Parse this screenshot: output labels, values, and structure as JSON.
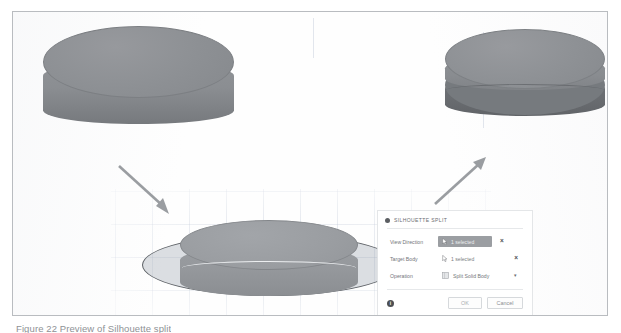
{
  "figure": {
    "caption": "Figure 22 Preview of Silhouette split"
  },
  "viewport": {
    "left_model_name": "solid-cylinder",
    "right_model_name": "split-cylinder",
    "preview_model_name": "preview-cylinder-with-split-plane",
    "arrow_down_right": "arrow-down-right",
    "arrow_up_right": "arrow-up-right"
  },
  "dialog": {
    "title": "SILHOUETTE SPLIT",
    "fields": [
      {
        "label": "View Direction",
        "value": "1 selected",
        "icon": "cursor-select-icon",
        "clear": "×",
        "active": true
      },
      {
        "label": "Target Body",
        "value": "1 selected",
        "icon": "cursor-select-icon",
        "clear": "×",
        "active": false
      }
    ],
    "operation": {
      "label": "Operation",
      "value": "Split Solid Body",
      "icon": "solid-body-icon",
      "caret": "▾",
      "options": [
        "Split Solid Body"
      ]
    },
    "footer": {
      "info": "i",
      "ok_label": "OK",
      "cancel_label": "Cancel"
    }
  },
  "colors": {
    "body_light": "#8d9094",
    "body_dark": "#6a6d71",
    "plane_fill": "rgba(150,158,170,0.33)",
    "plane_edge": "#5d6166",
    "arrow": "#9a9da1",
    "grid": "rgba(150,165,190,0.30)",
    "chip_active_bg": "#9b9ea2",
    "frame_border": "#b9bcc0"
  }
}
